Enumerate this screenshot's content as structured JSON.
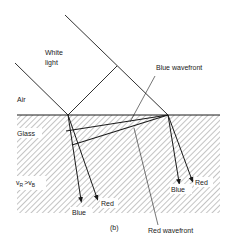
{
  "diagram": {
    "figure_label": "(b)",
    "labels": {
      "white_light": [
        "White",
        "light"
      ],
      "air": "Air",
      "glass": "Glass",
      "blue_wavefront": "Blue wavefront",
      "red_wavefront": "Red wavefront",
      "speed_relation": {
        "v1": "v",
        "s1": "R",
        "op": ">",
        "v2": "v",
        "s2": "B"
      },
      "left_blue": "Blue",
      "left_red": "Red",
      "right_blue": "Blue",
      "right_red": "Red"
    },
    "colors": {
      "line": "#1a1a1a",
      "hatch": "#8a8a8a",
      "background": "#ffffff"
    }
  }
}
